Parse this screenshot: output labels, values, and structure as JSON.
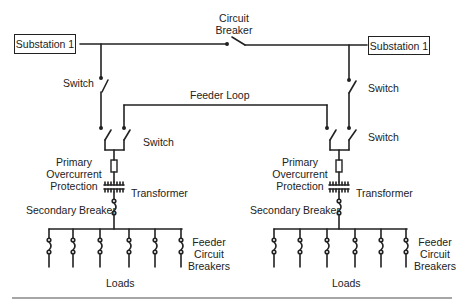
{
  "diagram": {
    "type": "power distribution one-line diagram",
    "substations": [
      {
        "label": "Substation 1",
        "side": "left"
      },
      {
        "label": "Substation 1",
        "side": "right"
      }
    ],
    "labels": {
      "circuit_breaker_line1": "Circuit",
      "circuit_breaker_line2": "Breaker",
      "feeder_loop": "Feeder Loop",
      "switch": "Switch",
      "primary_line1": "Primary",
      "primary_line2": "Overcurrent",
      "primary_line3": "Protection",
      "transformer": "Transformer",
      "secondary_breaker": "Secondary Breaker",
      "feeder_line1": "Feeder",
      "feeder_line2": "Circuit",
      "feeder_line3": "Breakers",
      "loads": "Loads"
    },
    "left": {
      "switch_upper": "Switch",
      "switch_lower": "Switch",
      "feeder_breaker_count": 6
    },
    "right": {
      "switch_upper": "Switch",
      "switch_lower": "Switch",
      "feeder_breaker_count": 6
    },
    "colors": {
      "line": "#222222",
      "background": "#ffffff",
      "rule": "#888888"
    }
  }
}
